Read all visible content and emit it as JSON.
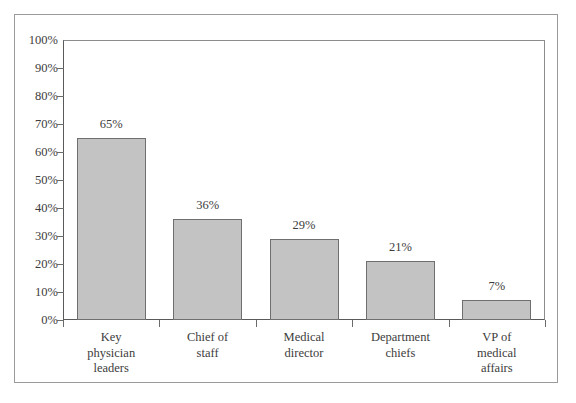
{
  "chart_data": {
    "type": "bar",
    "title": "",
    "subtitle": "",
    "xlabel": "",
    "ylabel": "",
    "categories": [
      "Key physician leaders",
      "Chief of staff",
      "Medical director",
      "Department chiefs",
      "VP of medical affairs"
    ],
    "category_lines": [
      [
        "Key",
        "physician",
        "leaders"
      ],
      [
        "Chief of",
        "staff"
      ],
      [
        "Medical",
        "director"
      ],
      [
        "Department",
        "chiefs"
      ],
      [
        "VP of",
        "medical",
        "affairs"
      ]
    ],
    "values": [
      65,
      36,
      29,
      21,
      7
    ],
    "value_labels": [
      "65%",
      "36%",
      "29%",
      "21%",
      "7%"
    ],
    "ylim": [
      0,
      100
    ],
    "ytick_values": [
      0,
      10,
      20,
      30,
      40,
      50,
      60,
      70,
      80,
      90,
      100
    ],
    "ytick_labels": [
      "0%",
      "10%",
      "20%",
      "30%",
      "40%",
      "50%",
      "60%",
      "70%",
      "80%",
      "90%",
      "100%"
    ],
    "grid": false,
    "legend": null,
    "colors": {
      "bar_fill": "#c3c3c3",
      "bar_stroke": "#6f6f6f",
      "axis": "#5a5a5a",
      "text": "#3c3c3c",
      "frame": "#9a9a9a",
      "background": "#ffffff"
    }
  }
}
